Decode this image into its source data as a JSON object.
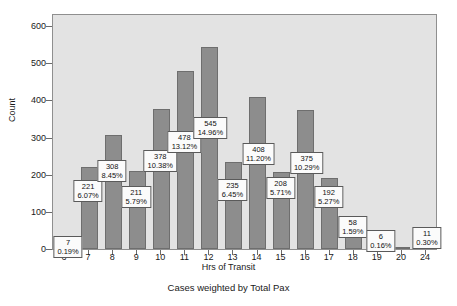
{
  "chart_data": {
    "type": "bar",
    "title": "",
    "subtitle": "",
    "caption": "Cases weighted by Total Pax",
    "xlabel": "Hrs of Transit",
    "ylabel": "Count",
    "ylim": [
      0,
      630
    ],
    "yticks": [
      0,
      100,
      200,
      300,
      400,
      500,
      600
    ],
    "grid": false,
    "legend": null,
    "categories": [
      "6",
      "7",
      "8",
      "9",
      "10",
      "11",
      "12",
      "13",
      "14",
      "15",
      "16",
      "17",
      "18",
      "19",
      "20",
      "24"
    ],
    "values": [
      7,
      221,
      308,
      211,
      378,
      478,
      545,
      235,
      408,
      208,
      375,
      192,
      58,
      6,
      1,
      11
    ],
    "percents": [
      "0.19%",
      "6.07%",
      "8.45%",
      "5.79%",
      "10.38%",
      "13.12%",
      "14.96%",
      "6.45%",
      "11.20%",
      "5.71%",
      "10.29%",
      "5.27%",
      "1.59%",
      "0.16%",
      "",
      "0.30%"
    ],
    "labels": [
      {
        "category": "6",
        "value": "7",
        "percent": "0.19%"
      },
      {
        "category": "7",
        "value": "221",
        "percent": "6.07%"
      },
      {
        "category": "8",
        "value": "308",
        "percent": "8.45%"
      },
      {
        "category": "9",
        "value": "211",
        "percent": "5.79%"
      },
      {
        "category": "10",
        "value": "378",
        "percent": "10.38%"
      },
      {
        "category": "11",
        "value": "478",
        "percent": "13.12%"
      },
      {
        "category": "12",
        "value": "545",
        "percent": "14.96%"
      },
      {
        "category": "13",
        "value": "235",
        "percent": "6.45%"
      },
      {
        "category": "14",
        "value": "408",
        "percent": "11.20%"
      },
      {
        "category": "15",
        "value": "208",
        "percent": "5.71%"
      },
      {
        "category": "16",
        "value": "375",
        "percent": "10.29%"
      },
      {
        "category": "17",
        "value": "192",
        "percent": "5.27%"
      },
      {
        "category": "18",
        "value": "58",
        "percent": "1.59%"
      },
      {
        "category": "19",
        "value": "6",
        "percent": "0.16%"
      },
      {
        "category": "24",
        "value": "11",
        "percent": "0.30%"
      }
    ],
    "colors": {
      "bar_fill": "#8d8d8d",
      "bar_border": "#6e6e6e",
      "plot_background": "#e3e3e3",
      "plot_border": "#8f8f8f",
      "page_background": "#ffffff",
      "label_background": "#fbfbfb",
      "label_border": "#5a5a5a",
      "text": "#1a1a1a"
    }
  }
}
